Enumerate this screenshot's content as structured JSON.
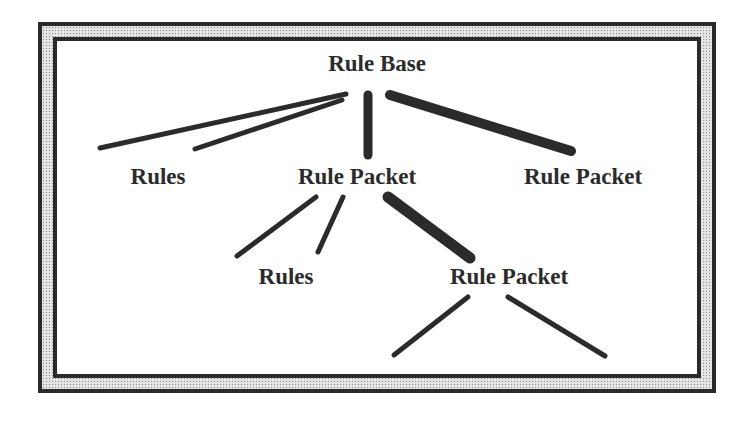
{
  "diagram": {
    "colors": {
      "ink": "#2b2b2b",
      "frame": "#2a2a2a",
      "stipple": "#e4e4e4",
      "background": "#ffffff"
    },
    "nodes": [
      {
        "id": "root",
        "label": "Rule Base",
        "x": 377,
        "y": 52
      },
      {
        "id": "rules1",
        "label": "Rules",
        "x": 158,
        "y": 165
      },
      {
        "id": "packet1",
        "label": "Rule Packet",
        "x": 357,
        "y": 165
      },
      {
        "id": "packet2",
        "label": "Rule Packet",
        "x": 583,
        "y": 165
      },
      {
        "id": "rules2",
        "label": "Rules",
        "x": 286,
        "y": 265
      },
      {
        "id": "packet3",
        "label": "Rule Packet",
        "x": 509,
        "y": 265
      }
    ],
    "edges": [
      {
        "from": "root",
        "to": "rules1",
        "x1": 346,
        "y1": 94,
        "x2": 100,
        "y2": 148,
        "w": 5
      },
      {
        "from": "root",
        "to": "rules1",
        "x1": 342,
        "y1": 100,
        "x2": 195,
        "y2": 149,
        "w": 5
      },
      {
        "from": "root",
        "to": "packet1",
        "x1": 368,
        "y1": 95,
        "x2": 368,
        "y2": 155,
        "w": 9
      },
      {
        "from": "root",
        "to": "packet2",
        "x1": 390,
        "y1": 95,
        "x2": 571,
        "y2": 151,
        "w": 10
      },
      {
        "from": "packet1",
        "to": "rules2",
        "x1": 316,
        "y1": 197,
        "x2": 237,
        "y2": 256,
        "w": 5
      },
      {
        "from": "packet1",
        "to": "rules2",
        "x1": 343,
        "y1": 197,
        "x2": 318,
        "y2": 252,
        "w": 5
      },
      {
        "from": "packet1",
        "to": "packet3",
        "x1": 388,
        "y1": 197,
        "x2": 470,
        "y2": 258,
        "w": 11
      },
      {
        "from": "packet3",
        "to": "child-a",
        "x1": 468,
        "y1": 297,
        "x2": 394,
        "y2": 355,
        "w": 5
      },
      {
        "from": "packet3",
        "to": "child-b",
        "x1": 508,
        "y1": 297,
        "x2": 605,
        "y2": 356,
        "w": 5
      }
    ]
  }
}
